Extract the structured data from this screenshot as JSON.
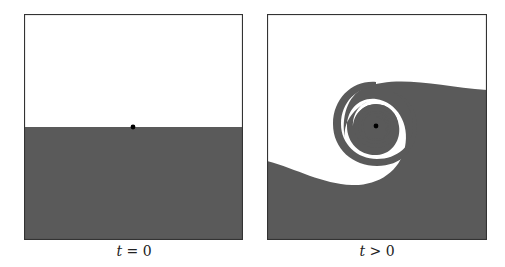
{
  "figure": {
    "panels": [
      {
        "id": "initial",
        "caption_var": "t",
        "caption_op": " = ",
        "caption_val": "0",
        "description": "flat interface between white upper fluid and dark lower fluid with a point vortex on the interface"
      },
      {
        "id": "evolved",
        "caption_var": "t",
        "caption_op": " > ",
        "caption_val": "0",
        "description": "interface rolled up into a spiral around the point vortex"
      }
    ],
    "colors": {
      "dark_fluid": "#5a5a5a",
      "light_fluid": "#ffffff",
      "border": "#333333",
      "vortex": "#000000"
    }
  }
}
